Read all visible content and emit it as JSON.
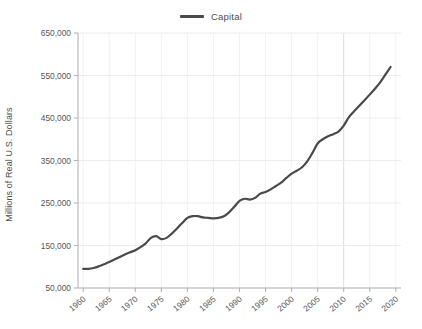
{
  "legend": {
    "position": "top-center",
    "entries": [
      {
        "label": "Capital",
        "color": "#4a4a4a",
        "marker": "line-swatch"
      }
    ]
  },
  "axes": {
    "y_title": "Millions of Real U.S. Dollars",
    "x_title": "",
    "y_ticks": [
      "50,000",
      "150,000",
      "250,000",
      "350,000",
      "450,000",
      "550,000",
      "650,000"
    ],
    "x_ticks": [
      "1960",
      "1965",
      "1970",
      "1975",
      "1980",
      "1985",
      "1990",
      "1995",
      "2000",
      "2005",
      "2010",
      "2015",
      "2020"
    ]
  },
  "style": {
    "background": "#ffffff",
    "grid_color": "#ececed",
    "axis_color": "#b4b4b6",
    "text_color": "#55555a",
    "line_color": "#4a4a4a"
  },
  "chart_data": {
    "type": "line",
    "title": "",
    "subtitle": "",
    "xlabel": "",
    "ylabel": "Millions of Real U.S. Dollars",
    "xlim": [
      1959,
      2021
    ],
    "ylim": [
      50000,
      650000
    ],
    "ytick_values": [
      50000,
      150000,
      250000,
      350000,
      450000,
      550000,
      650000
    ],
    "xtick_values": [
      1960,
      1965,
      1970,
      1975,
      1980,
      1985,
      1990,
      1995,
      2000,
      2005,
      2010,
      2015,
      2020
    ],
    "grid": true,
    "legend_position": "top-center",
    "series": [
      {
        "name": "Capital",
        "color": "#4a4a4a",
        "x": [
          1960,
          1961,
          1962,
          1963,
          1964,
          1965,
          1966,
          1967,
          1968,
          1969,
          1970,
          1971,
          1972,
          1973,
          1974,
          1975,
          1976,
          1977,
          1978,
          1979,
          1980,
          1981,
          1982,
          1983,
          1984,
          1985,
          1986,
          1987,
          1988,
          1989,
          1990,
          1991,
          1992,
          1993,
          1994,
          1995,
          1996,
          1997,
          1998,
          1999,
          2000,
          2001,
          2002,
          2003,
          2004,
          2005,
          2006,
          2007,
          2008,
          2009,
          2010,
          2011,
          2012,
          2013,
          2014,
          2015,
          2016,
          2017,
          2018,
          2019
        ],
        "values": [
          95000,
          95000,
          97000,
          101000,
          106000,
          111000,
          117000,
          123000,
          129000,
          134000,
          139000,
          146000,
          155000,
          168000,
          172000,
          165000,
          168000,
          178000,
          190000,
          203000,
          215000,
          219000,
          219000,
          216000,
          215000,
          214000,
          215000,
          219000,
          228000,
          241000,
          255000,
          260000,
          258000,
          262000,
          272000,
          276000,
          282000,
          290000,
          298000,
          309000,
          319000,
          326000,
          334000,
          348000,
          368000,
          390000,
          400000,
          407000,
          412000,
          418000,
          432000,
          452000,
          466000,
          479000,
          492000,
          505000,
          519000,
          534000,
          552000,
          570000
        ]
      }
    ]
  }
}
